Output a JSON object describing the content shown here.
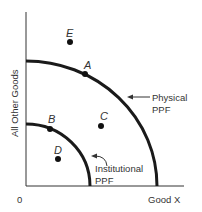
{
  "diagram": {
    "title": "",
    "axes": {
      "y_label": "All Other Goods",
      "x_label": "Good X",
      "origin_label": "0"
    },
    "curves": [
      {
        "name": "Physical PPF",
        "label_line1": "Physical",
        "label_line2": "PPF"
      },
      {
        "name": "Institutional PPF",
        "label_line1": "Institutional",
        "label_line2": "PPF"
      }
    ],
    "points": [
      {
        "label": "E",
        "position": "outside physical PPF"
      },
      {
        "label": "A",
        "position": "on physical PPF"
      },
      {
        "label": "B",
        "position": "on institutional PPF"
      },
      {
        "label": "C",
        "position": "between institutional and physical PPF"
      },
      {
        "label": "D",
        "position": "inside institutional PPF"
      }
    ],
    "colors": {
      "curve": "#1a1a1a",
      "axis": "#333333",
      "text": "#333333",
      "background": "#ffffff"
    }
  }
}
